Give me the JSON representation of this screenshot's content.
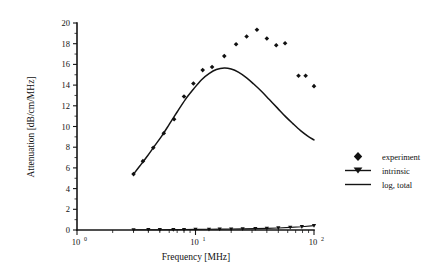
{
  "chart_data": {
    "type": "scatter",
    "title": "",
    "xlabel": "Frequency [MHz]",
    "ylabel": "Attenuation [dB/cm/MHz]",
    "xscale": "log",
    "yscale": "linear",
    "xlim": [
      1,
      100
    ],
    "ylim": [
      0,
      20
    ],
    "grid": false,
    "legend_position": "right",
    "x_tick_labels": [
      "10 0",
      "10 1",
      "10 2"
    ],
    "x_tick_mantissa": [
      "10",
      "10",
      "10"
    ],
    "x_tick_exponents": [
      "0",
      "1",
      "2"
    ],
    "x_tick_values": [
      1,
      10,
      100
    ],
    "y_tick_labels": [
      "0",
      "2",
      "4",
      "6",
      "8",
      "10",
      "12",
      "14",
      "16",
      "18",
      "20"
    ],
    "y_tick_values": [
      0,
      2,
      4,
      6,
      8,
      10,
      12,
      14,
      16,
      18,
      20
    ],
    "series": [
      {
        "name": "experiment",
        "marker": "diamond",
        "style": "points",
        "points": [
          [
            3.0,
            5.4
          ],
          [
            3.6,
            6.65
          ],
          [
            4.4,
            7.95
          ],
          [
            5.4,
            9.35
          ],
          [
            6.6,
            10.7
          ],
          [
            8.0,
            12.9
          ],
          [
            9.6,
            14.15
          ],
          [
            11.5,
            15.45
          ],
          [
            13.8,
            15.75
          ],
          [
            17.5,
            16.8
          ],
          [
            22.0,
            17.95
          ],
          [
            27.0,
            18.7
          ],
          [
            33.0,
            19.35
          ],
          [
            40.0,
            18.5
          ],
          [
            48.0,
            17.85
          ],
          [
            57.0,
            18.05
          ],
          [
            74.0,
            14.9
          ],
          [
            85.0,
            14.9
          ],
          [
            100.0,
            13.9
          ]
        ]
      },
      {
        "name": "intrinsic",
        "marker": "triangle-down",
        "style": "line-and-points",
        "points": [
          [
            3.0,
            0.02
          ],
          [
            4.0,
            0.03
          ],
          [
            5.0,
            0.03
          ],
          [
            6.5,
            0.04
          ],
          [
            8.0,
            0.05
          ],
          [
            10.0,
            0.06
          ],
          [
            13.0,
            0.07
          ],
          [
            16.0,
            0.08
          ],
          [
            20.0,
            0.09
          ],
          [
            25.0,
            0.11
          ],
          [
            32.0,
            0.13
          ],
          [
            40.0,
            0.16
          ],
          [
            50.0,
            0.2
          ],
          [
            63.0,
            0.25
          ],
          [
            79.0,
            0.32
          ],
          [
            100.0,
            0.42
          ]
        ]
      },
      {
        "name": "log, total",
        "marker": "none",
        "style": "line",
        "points": [
          [
            3.0,
            5.4
          ],
          [
            3.4,
            6.2
          ],
          [
            3.9,
            7.1
          ],
          [
            4.5,
            8.1
          ],
          [
            5.2,
            9.1
          ],
          [
            6.0,
            10.2
          ],
          [
            7.0,
            11.4
          ],
          [
            8.2,
            12.6
          ],
          [
            9.6,
            13.6
          ],
          [
            11.2,
            14.5
          ],
          [
            13.0,
            15.1
          ],
          [
            15.0,
            15.5
          ],
          [
            17.5,
            15.65
          ],
          [
            20.0,
            15.55
          ],
          [
            23.0,
            15.25
          ],
          [
            27.0,
            14.7
          ],
          [
            31.0,
            14.1
          ],
          [
            36.0,
            13.4
          ],
          [
            42.0,
            12.6
          ],
          [
            49.0,
            11.8
          ],
          [
            57.0,
            11.0
          ],
          [
            66.0,
            10.3
          ],
          [
            77.0,
            9.6
          ],
          [
            88.0,
            9.1
          ],
          [
            100.0,
            8.7
          ]
        ]
      }
    ]
  },
  "legend": {
    "entries": [
      {
        "label": "experiment",
        "marker": "diamond"
      },
      {
        "label": "intrinsic",
        "marker": "triangle-down-line"
      },
      {
        "label": "log, total",
        "marker": "line"
      }
    ]
  }
}
